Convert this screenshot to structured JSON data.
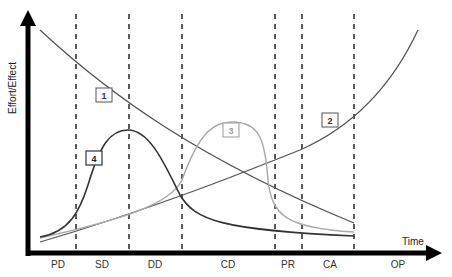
{
  "chart_data": {
    "type": "line",
    "title": "",
    "xlabel": "Time",
    "ylabel": "Effort/Effect",
    "phases": [
      "PD",
      "SD",
      "DD",
      "CD",
      "PR",
      "CA",
      "OP"
    ],
    "phase_boundaries_px": [
      76,
      129,
      182,
      275,
      302,
      354
    ],
    "grid": false,
    "legend_position": "inline numbered boxes on curves",
    "series": [
      {
        "name": "1",
        "description": "Decreasing curve from top-left to lower right",
        "color": "#555555",
        "path": "M40,30 C110,95 200,160 354,223",
        "label_pos": [
          104,
          95
        ]
      },
      {
        "name": "2",
        "description": "Exponentially increasing curve from bottom-left to top-right",
        "color": "#555555",
        "path": "M40,242 C150,210 250,170 300,150 C350,128 390,90 418,30",
        "label_pos": [
          330,
          120
        ]
      },
      {
        "name": "3",
        "description": "Light gray bell curve peaking in CD phase",
        "color": "#aaaaaa",
        "path": "M40,238 C120,220 170,205 182,180 C200,130 215,122 232,122 C260,122 265,140 268,180 C272,215 285,228 354,232",
        "label_pos": [
          231,
          130
        ]
      },
      {
        "name": "4",
        "description": "Dark bell curve peaking in SD/DD boundary",
        "color": "#333333",
        "path": "M40,237 C70,232 80,210 88,185 C100,145 110,130 128,130 C150,130 165,165 180,195 C195,220 220,230 354,236",
        "label_pos": [
          94,
          158
        ]
      }
    ]
  },
  "axes": {
    "y_label": "Effort/Effect",
    "x_label": "Time"
  },
  "phase_labels": [
    {
      "text": "PD",
      "x": 58
    },
    {
      "text": "SD",
      "x": 102
    },
    {
      "text": "DD",
      "x": 155
    },
    {
      "text": "CD",
      "x": 228
    },
    {
      "text": "PR",
      "x": 288
    },
    {
      "text": "CA",
      "x": 330
    },
    {
      "text": "OP",
      "x": 398
    }
  ],
  "curve_labels": [
    "1",
    "2",
    "3",
    "4"
  ]
}
